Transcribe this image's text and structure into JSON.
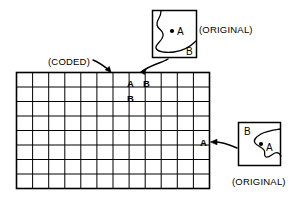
{
  "figure": {
    "stroke_color": "#000000",
    "background_color": "#ffffff"
  },
  "labels": {
    "coded": "(CODED)",
    "original_top": "(ORIGINAL)",
    "original_bottom": "(ORIGINAL)"
  },
  "grid": {
    "columns": 12,
    "rows": 8,
    "x": 16,
    "y": 72,
    "width": 194,
    "height": 117,
    "cell_markers": [
      {
        "label": "A",
        "col": 7,
        "row": 1
      },
      {
        "label": "B",
        "col": 8,
        "row": 1
      },
      {
        "label": "B",
        "col": 7,
        "row": 2
      },
      {
        "label": "A",
        "col": 12,
        "row": 5
      }
    ]
  },
  "insets": [
    {
      "name": "original-top",
      "caption": "(ORIGINAL)",
      "caption_position": "right",
      "points": [
        {
          "label": "A",
          "dot": true
        },
        {
          "label": "B",
          "dot": false
        }
      ]
    },
    {
      "name": "original-bottom",
      "caption": "(ORIGINAL)",
      "caption_position": "below",
      "points": [
        {
          "label": "B",
          "dot": false
        },
        {
          "label": "A",
          "dot": true
        }
      ]
    }
  ],
  "connectors": [
    {
      "name": "coded-pointer",
      "from": "coded-label",
      "to": "grid-top"
    },
    {
      "name": "top-inset-arrow",
      "from": "original-top-inset",
      "to": "grid-cell-A"
    },
    {
      "name": "bottom-inset-arrow",
      "from": "original-bottom-inset",
      "to": "grid-cell-A-right"
    }
  ]
}
